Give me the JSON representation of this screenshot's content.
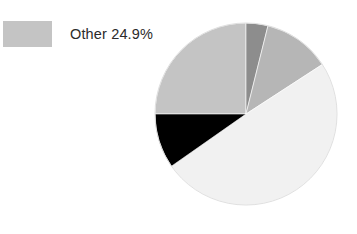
{
  "chart_data": {
    "type": "pie",
    "title": "",
    "legend_position": "left",
    "grid": false,
    "labels": [
      "Other",
      "Slice 2",
      "Slice 3",
      "Slice 4",
      "Slice 5"
    ],
    "values": [
      24.9,
      4.0,
      12.0,
      49.0,
      10.1
    ],
    "colors": [
      "#c4c4c4",
      "#8d8d8d",
      "#b6b6b6",
      "#f1f1f1",
      "#000000"
    ],
    "annotations": [
      "Other 24.9%"
    ],
    "slices": [
      {
        "label": "Other",
        "value": 24.9,
        "display": "24.9%",
        "color": "#c4c4c4",
        "start_angle": 270,
        "end_angle": 360,
        "in_legend": true
      },
      {
        "label": "Slice 2",
        "value": 4.0,
        "display": "",
        "color": "#8d8d8d",
        "start_angle": 0,
        "end_angle": 14,
        "in_legend": false
      },
      {
        "label": "Slice 3",
        "value": 12.0,
        "display": "",
        "color": "#b6b6b6",
        "start_angle": 14,
        "end_angle": 57,
        "in_legend": false
      },
      {
        "label": "Slice 4",
        "value": 49.0,
        "display": "",
        "color": "#f1f1f1",
        "start_angle": 57,
        "end_angle": 235,
        "in_legend": false
      },
      {
        "label": "Slice 5",
        "value": 10.1,
        "display": "",
        "color": "#000000",
        "start_angle": 235,
        "end_angle": 270,
        "in_legend": false
      }
    ],
    "geometry": {
      "center_x": 92,
      "center_y": 93,
      "radius": 91
    }
  },
  "legend": {
    "entries": [
      {
        "label": "Other 24.9%",
        "color": "#c4c4c4"
      }
    ]
  }
}
